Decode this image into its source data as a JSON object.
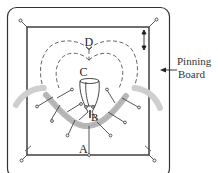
{
  "diagram": {
    "labels": {
      "A": "A",
      "B": "B",
      "C": "C",
      "D": "D"
    },
    "callout": {
      "line1": "Pinning",
      "line2": "Board"
    },
    "colors": {
      "line": "#333333",
      "dashed": "#555555",
      "lace": "#aaaaaa",
      "lace_light": "#cccccc"
    },
    "elements": [
      "outer-rounded-board",
      "inner-square-frame",
      "corner-pins",
      "heart-dashed-outline-outer",
      "heart-dashed-outline-inner",
      "cup-shape",
      "lace-garland",
      "radial-pins",
      "vertical-adjust-arrow",
      "pointer-arrow-to-board"
    ]
  }
}
